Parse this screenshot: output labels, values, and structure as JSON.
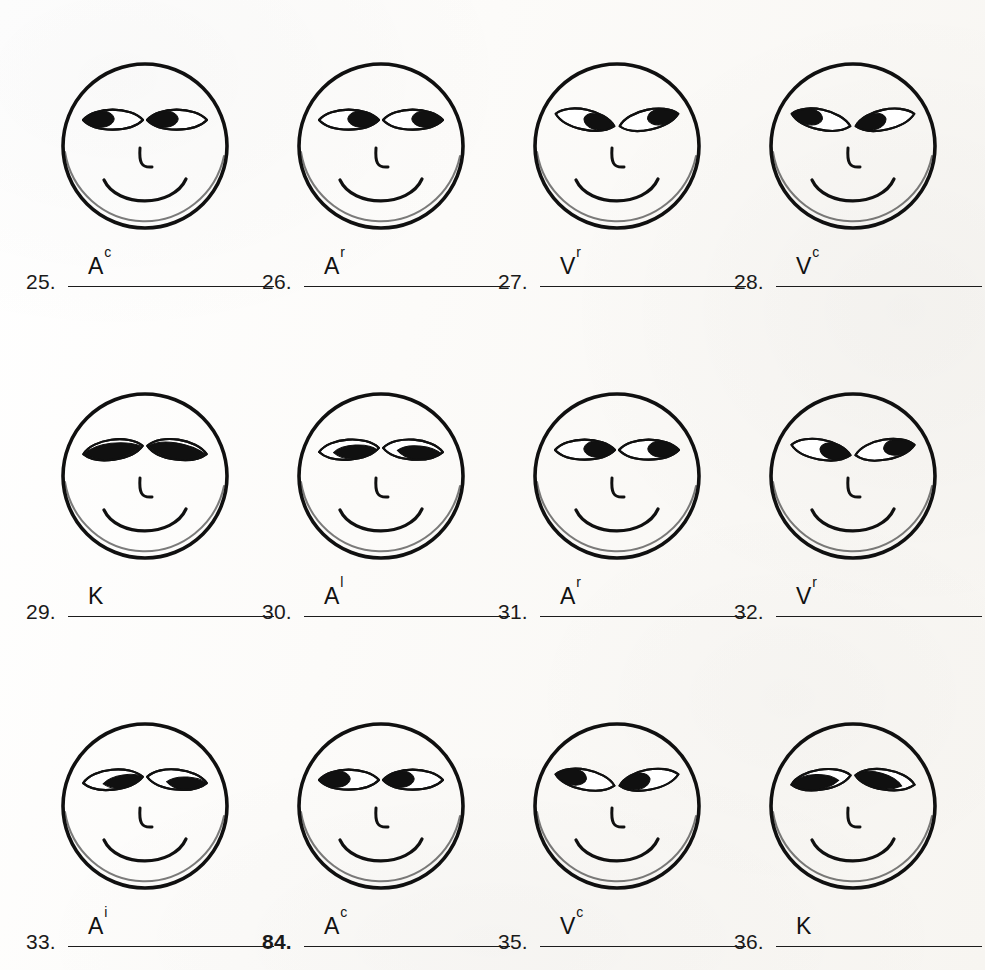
{
  "document": {
    "kind": "eye-position-assessment-worksheet",
    "sheet_background": "#fbfaf8",
    "ink_color": "#101010",
    "rows": 3,
    "columns": 4
  },
  "items": [
    {
      "number": "25.",
      "number_bold": false,
      "answer_base": "A",
      "answer_sup": "c",
      "answer_text": "A c",
      "face": {
        "name": "smiley-face-25",
        "eye_style": "horizontal-almond",
        "eye_tilt_deg": 0,
        "pupil_position": "left",
        "pupil_fill": "partial",
        "nose": "L-shape",
        "mouth": "smile-arc"
      }
    },
    {
      "number": "26.",
      "number_bold": false,
      "answer_base": "A",
      "answer_sup": "r",
      "answer_text": "A r",
      "face": {
        "name": "smiley-face-26",
        "eye_style": "horizontal-almond",
        "eye_tilt_deg": 0,
        "pupil_position": "right",
        "pupil_fill": "partial",
        "nose": "L-shape",
        "mouth": "smile-arc"
      }
    },
    {
      "number": "27.",
      "number_bold": false,
      "answer_base": "V",
      "answer_sup": "r",
      "answer_text": "V r",
      "face": {
        "name": "smiley-face-27",
        "eye_style": "slanted-almond",
        "eye_tilt_deg": -12,
        "pupil_position": "right",
        "pupil_fill": "large",
        "nose": "L-shape",
        "mouth": "smile-arc"
      }
    },
    {
      "number": "28.",
      "number_bold": false,
      "answer_base": "V",
      "answer_sup": "c",
      "answer_text": "V c",
      "face": {
        "name": "smiley-face-28",
        "eye_style": "slanted-almond",
        "eye_tilt_deg": -12,
        "pupil_position": "left",
        "pupil_fill": "large",
        "nose": "L-shape",
        "mouth": "smile-arc"
      }
    },
    {
      "number": "29.",
      "number_bold": false,
      "answer_base": "K",
      "answer_sup": "",
      "answer_text": "K",
      "face": {
        "name": "smiley-face-29",
        "eye_style": "slanted-almond",
        "eye_tilt_deg": 8,
        "pupil_position": "lower-wide",
        "pupil_fill": "full",
        "nose": "L-shape",
        "mouth": "smile-arc"
      }
    },
    {
      "number": "30.",
      "number_bold": false,
      "answer_base": "A",
      "answer_sup": "l",
      "answer_text": "A l",
      "face": {
        "name": "smiley-face-30",
        "eye_style": "horizontal-almond",
        "eye_tilt_deg": 4,
        "pupil_position": "lower",
        "pupil_fill": "large",
        "nose": "L-shape",
        "mouth": "smile-arc"
      }
    },
    {
      "number": "31.",
      "number_bold": false,
      "answer_base": "A",
      "answer_sup": "r",
      "answer_text": "A r",
      "face": {
        "name": "smiley-face-31",
        "eye_style": "horizontal-almond",
        "eye_tilt_deg": 0,
        "pupil_position": "right",
        "pupil_fill": "partial",
        "nose": "L-shape",
        "mouth": "smile-arc"
      }
    },
    {
      "number": "32.",
      "number_bold": false,
      "answer_base": "V",
      "answer_sup": "r",
      "answer_text": "V r",
      "face": {
        "name": "smiley-face-32",
        "eye_style": "slanted-almond",
        "eye_tilt_deg": -10,
        "pupil_position": "right",
        "pupil_fill": "large",
        "nose": "L-shape",
        "mouth": "smile-arc"
      }
    },
    {
      "number": "33.",
      "number_bold": false,
      "answer_base": "A",
      "answer_sup": "i",
      "answer_text": "A i",
      "face": {
        "name": "smiley-face-33",
        "eye_style": "horizontal-almond",
        "eye_tilt_deg": 6,
        "pupil_position": "lower-right",
        "pupil_fill": "large",
        "nose": "L-shape",
        "mouth": "smile-arc"
      }
    },
    {
      "number": "84.",
      "number_bold": true,
      "answer_base": "A",
      "answer_sup": "c",
      "answer_text": "A c",
      "face": {
        "name": "smiley-face-34",
        "eye_style": "horizontal-almond",
        "eye_tilt_deg": 0,
        "pupil_position": "left",
        "pupil_fill": "partial",
        "nose": "L-shape",
        "mouth": "smile-arc"
      }
    },
    {
      "number": "35.",
      "number_bold": false,
      "answer_base": "V",
      "answer_sup": "c",
      "answer_text": "V c",
      "face": {
        "name": "smiley-face-35",
        "eye_style": "slanted-almond",
        "eye_tilt_deg": -11,
        "pupil_position": "left",
        "pupil_fill": "large",
        "nose": "L-shape",
        "mouth": "smile-arc"
      }
    },
    {
      "number": "36.",
      "number_bold": false,
      "answer_base": "K",
      "answer_sup": "",
      "answer_text": "K",
      "face": {
        "name": "smiley-face-36",
        "eye_style": "slanted-almond",
        "eye_tilt_deg": 9,
        "pupil_position": "left-lower",
        "pupil_fill": "full",
        "nose": "L-shape",
        "mouth": "smile-arc"
      }
    }
  ]
}
